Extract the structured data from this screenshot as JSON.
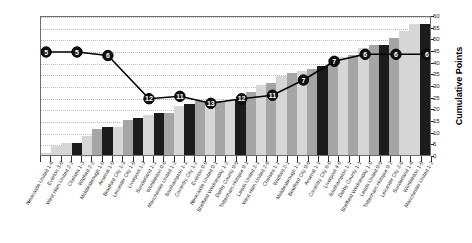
{
  "chart_data": {
    "type": "bar",
    "title": "",
    "xlabel": "",
    "ylabel": "Cumulative Points",
    "ylim": [
      0,
      60
    ],
    "ytick_step": 5,
    "yticks": [
      0,
      5,
      10,
      15,
      20,
      25,
      30,
      35,
      40,
      45,
      50,
      55,
      60
    ],
    "grid": true,
    "legend": "none",
    "categories": [
      "Newcastle United  1-0",
      "Everton  3-0",
      "West Ham United  2-2",
      "Chelsea  1-3",
      "Watford  2-2",
      "Middlesbrough  1-0",
      "Arsenal  1-0",
      "Bradford City  1-3",
      "Leicester City  1-0",
      "Liverpool  1-3",
      "Sunderland  1-1",
      "Wimbledon  0-0",
      "Manchester United  1-2",
      "Southampton  1-1",
      "Coventry City  1-2",
      "Everton  0-0",
      "Newcastle United  0-1",
      "Sheffield Wednesday  1-2",
      "Derby County  0-0",
      "Tottenham Hotspur  0-1",
      "Leeds United  2-1",
      "West Ham United  2-0",
      "Chelsea  1-1",
      "Watford  2-1",
      "Middlesbrough  1-1",
      "Bradford City  0-0",
      "Arsenal  1-1",
      "Coventry City  0-0",
      "Liverpool  4-0",
      "Southampton  1-1",
      "Derby County  1-1",
      "Sheffield Wednesday  1-0",
      "Leeds United  0-0",
      "Tottenham Hotspur  0-2",
      "Leicester City  2-0",
      "Sunderland  1-0",
      "Wimbledon  1-0",
      "Manchester United  1-2"
    ],
    "series": [
      {
        "name": "Cumulative Points",
        "type": "bar",
        "values": [
          1,
          4,
          5,
          5,
          8,
          11,
          12,
          12,
          15,
          16,
          17,
          18,
          18,
          21,
          22,
          23,
          23,
          23,
          24,
          24,
          27,
          30,
          31,
          34,
          35,
          36,
          37,
          38,
          41,
          42,
          43,
          46,
          47,
          47,
          50,
          53,
          56,
          56
        ]
      },
      {
        "name": "League Position",
        "type": "line",
        "marker_labels": [
          "5",
          "5",
          "6",
          "12",
          "11",
          "13",
          "12",
          "11",
          "7",
          "7",
          "6",
          "6",
          "6"
        ],
        "marker_indices": [
          0,
          3,
          6,
          10,
          13,
          16,
          19,
          22,
          25,
          28,
          31,
          34,
          37
        ],
        "marker_y_points": [
          45,
          45,
          43.5,
          25,
          26,
          23,
          25,
          26.5,
          33,
          41,
          44,
          44,
          44
        ]
      }
    ],
    "bar_shades": [
      "light",
      "light",
      "light",
      "dark",
      "light",
      "mid",
      "dark",
      "light",
      "mid",
      "dark",
      "light",
      "dark",
      "mid",
      "light",
      "dark",
      "mid",
      "light",
      "mid",
      "light",
      "dark",
      "mid",
      "light",
      "mid",
      "light",
      "mid",
      "light",
      "mid",
      "dark",
      "mid",
      "light",
      "mid",
      "light",
      "mid",
      "dark",
      "mid",
      "light",
      "light",
      "dark"
    ]
  },
  "colors": {
    "bar_light": "#d6d6d6",
    "bar_mid": "#a5a5a5",
    "bar_dark": "#1c1c1c",
    "line": "#000000",
    "marker_fill": "#111111",
    "marker_text": "#ffffff",
    "grid": "#b8b8b8",
    "frame": "#6e6e6e",
    "plot_bg": "#ffffff"
  },
  "axis": {
    "y_title": "Cumulative Points"
  }
}
